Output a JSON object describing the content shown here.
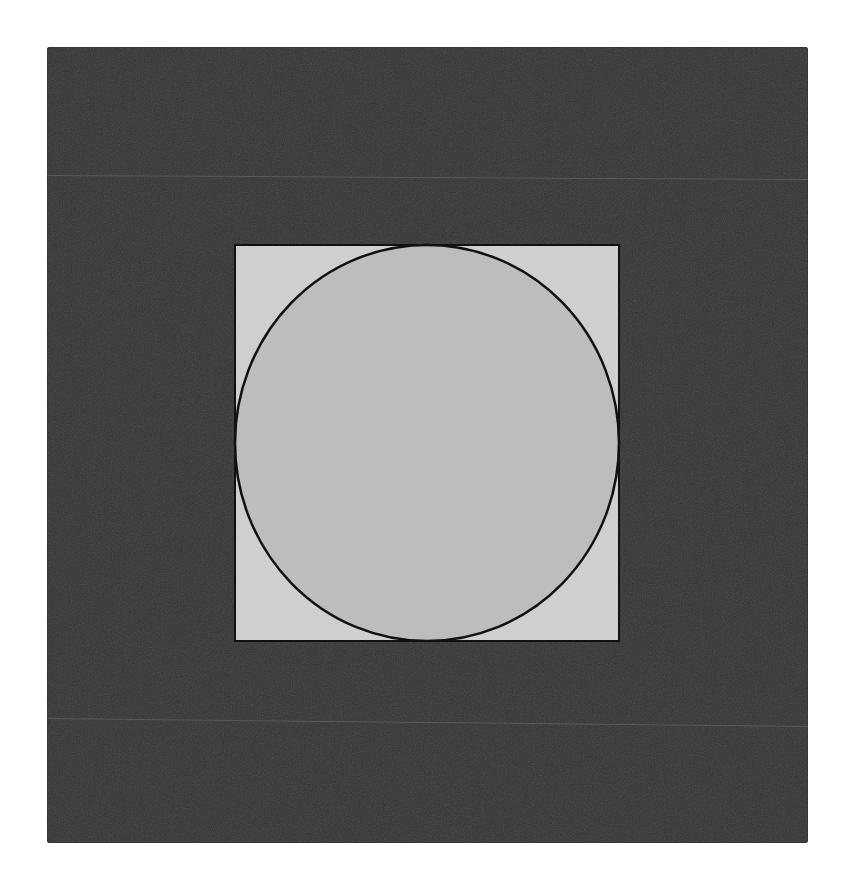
{
  "diagram": {
    "type": "circle-inscribed-in-square",
    "colors": {
      "page_background": "#ffffff",
      "outer_square_fill": "#333333",
      "inner_square_fill": "#cfcfcf",
      "circle_fill": "#bdbdbd",
      "stroke": "#111111",
      "streak": "#8c8c8c"
    },
    "outer_square": {
      "x": 47,
      "y": 47,
      "width": 761,
      "height": 796
    },
    "inner_square": {
      "x": 234,
      "y": 244,
      "width": 386,
      "height": 398
    },
    "circle": {
      "cx": 427,
      "cy": 443,
      "rx": 192,
      "ry": 198
    }
  }
}
